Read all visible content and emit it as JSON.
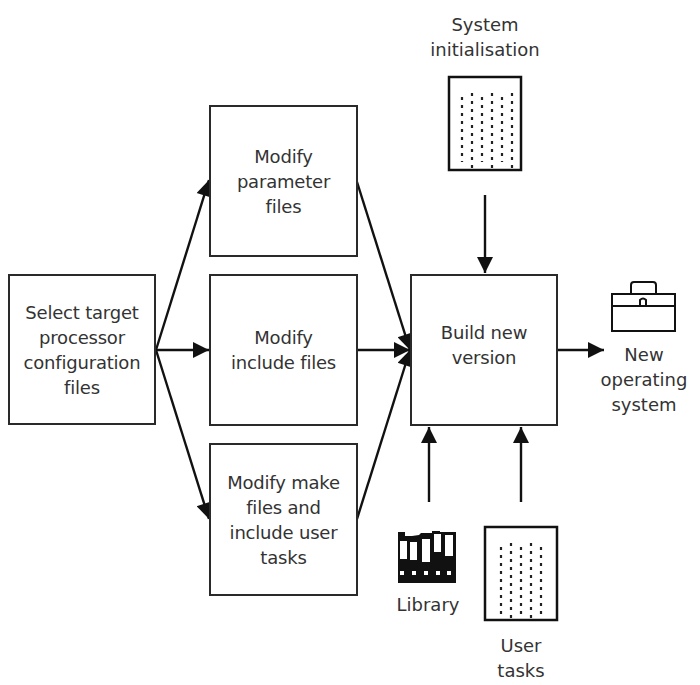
{
  "diagram": {
    "nodes": {
      "select": {
        "label": "Select target\nprocessor\nconfiguration\nfiles"
      },
      "params": {
        "label": "Modify\nparameter\nfiles"
      },
      "include": {
        "label": "Modify\ninclude files"
      },
      "make": {
        "label": "Modify make\nfiles and\ninclude user\ntasks"
      },
      "build": {
        "label": "Build new\nversion"
      }
    },
    "inputs": {
      "system_init": {
        "label": "System\ninitialisation",
        "icon": "document-icon"
      },
      "library": {
        "label": "Library",
        "icon": "library-binders-icon"
      },
      "user_tasks": {
        "label": "User\ntasks",
        "icon": "document-icon"
      }
    },
    "output": {
      "label": "New\noperating\nsystem",
      "icon": "toolbox-icon"
    },
    "edges": [
      {
        "from": "select",
        "to": "params"
      },
      {
        "from": "select",
        "to": "include"
      },
      {
        "from": "select",
        "to": "make"
      },
      {
        "from": "params",
        "to": "build"
      },
      {
        "from": "include",
        "to": "build"
      },
      {
        "from": "make",
        "to": "build"
      },
      {
        "from": "system_init",
        "to": "build"
      },
      {
        "from": "library",
        "to": "build"
      },
      {
        "from": "user_tasks",
        "to": "build"
      },
      {
        "from": "build",
        "to": "output"
      }
    ]
  }
}
